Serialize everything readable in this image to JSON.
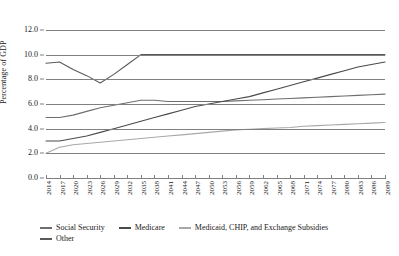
{
  "chart_data": {
    "type": "line",
    "title": "",
    "xlabel": "",
    "ylabel": "Percentage of GDP",
    "ylim": [
      0.0,
      12.0
    ],
    "ytick_step": 2.0,
    "yticks": [
      "0.0",
      "2.0",
      "4.0",
      "6.0",
      "8.0",
      "10.0",
      "12.0"
    ],
    "grid": true,
    "legend_position": "bottom-left",
    "xlim": [
      2014,
      2089
    ],
    "xtick_step": 3,
    "x": [
      2014,
      2017,
      2020,
      2023,
      2026,
      2029,
      2032,
      2035,
      2038,
      2041,
      2044,
      2047,
      2050,
      2053,
      2056,
      2059,
      2062,
      2065,
      2068,
      2071,
      2074,
      2077,
      2080,
      2083,
      2086,
      2089
    ],
    "xticks": [
      "2014",
      "2017",
      "2020",
      "2023",
      "2026",
      "2029",
      "2032",
      "2035",
      "2038",
      "2041",
      "2044",
      "2047",
      "2050",
      "2053",
      "2056",
      "2059",
      "2062",
      "2065",
      "2068",
      "2071",
      "2074",
      "2077",
      "2080",
      "2083",
      "2086",
      "2089"
    ],
    "series": [
      {
        "name": "Social Security",
        "color": "#6e6e6e",
        "x": [
          2014,
          2017,
          2020,
          2023,
          2026,
          2029,
          2032,
          2035,
          2038,
          2041,
          2044,
          2047,
          2050,
          2053,
          2056,
          2059,
          2062,
          2065,
          2068,
          2071,
          2074,
          2077,
          2080,
          2083,
          2086,
          2089
        ],
        "values": [
          4.9,
          4.9,
          5.1,
          5.4,
          5.7,
          5.9,
          6.1,
          6.3,
          6.3,
          6.2,
          6.2,
          6.2,
          6.2,
          6.2,
          6.25,
          6.3,
          6.35,
          6.4,
          6.45,
          6.5,
          6.55,
          6.6,
          6.65,
          6.7,
          6.75,
          6.8
        ]
      },
      {
        "name": "Medicare",
        "color": "#4a4a4a",
        "x": [
          2014,
          2017,
          2020,
          2023,
          2026,
          2029,
          2032,
          2035,
          2038,
          2041,
          2044,
          2047,
          2050,
          2053,
          2056,
          2059,
          2062,
          2065,
          2068,
          2071,
          2074,
          2077,
          2080,
          2083,
          2086,
          2089
        ],
        "values": [
          3.0,
          3.0,
          3.2,
          3.4,
          3.7,
          4.0,
          4.3,
          4.6,
          4.9,
          5.2,
          5.5,
          5.8,
          6.0,
          6.2,
          6.4,
          6.6,
          6.9,
          7.2,
          7.5,
          7.8,
          8.1,
          8.4,
          8.7,
          9.0,
          9.2,
          9.4
        ]
      },
      {
        "name": "Medicaid, CHIP, and Exchange Subsidies",
        "color": "#a8a8a8",
        "x": [
          2014,
          2017,
          2020,
          2023,
          2026,
          2029,
          2032,
          2035,
          2038,
          2041,
          2044,
          2047,
          2050,
          2053,
          2056,
          2059,
          2062,
          2065,
          2068,
          2071,
          2074,
          2077,
          2080,
          2083,
          2086,
          2089
        ],
        "values": [
          2.0,
          2.5,
          2.7,
          2.8,
          2.9,
          3.0,
          3.1,
          3.2,
          3.3,
          3.4,
          3.5,
          3.6,
          3.7,
          3.8,
          3.9,
          3.95,
          4.0,
          4.05,
          4.1,
          4.2,
          4.25,
          4.3,
          4.35,
          4.4,
          4.45,
          4.5
        ]
      },
      {
        "name": "Other",
        "color": "#5a5a5a",
        "x": [
          2014,
          2017,
          2020,
          2023,
          2026,
          2029,
          2032,
          2035,
          2038,
          2041,
          2044,
          2047,
          2050,
          2053,
          2056,
          2059,
          2062,
          2065,
          2068,
          2071,
          2074,
          2077,
          2080,
          2083,
          2086,
          2089
        ],
        "values": [
          9.3,
          9.4,
          8.8,
          8.3,
          7.7,
          8.4,
          9.2,
          10.0,
          10.0,
          10.0,
          10.0,
          10.0,
          10.0,
          10.0,
          10.0,
          10.0,
          10.0,
          10.0,
          10.0,
          10.0,
          10.0,
          10.0,
          10.0,
          10.0,
          10.0,
          10.0
        ]
      }
    ]
  },
  "legend": {
    "items": [
      {
        "label": "Social Security",
        "color": "#6e6e6e"
      },
      {
        "label": "Medicare",
        "color": "#4a4a4a"
      },
      {
        "label": "Medicaid, CHIP, and Exchange Subsidies",
        "color": "#a8a8a8"
      },
      {
        "label": "Other",
        "color": "#5a5a5a"
      }
    ]
  },
  "colors": {
    "grid": "#808080",
    "axis": "#808080",
    "text": "#1a1a1a",
    "background": "#ffffff"
  }
}
